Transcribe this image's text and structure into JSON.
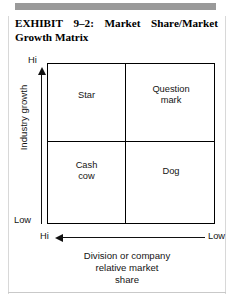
{
  "exhibit": {
    "label": "EXHIBIT",
    "number": "9–2:",
    "title_part_1": "Market",
    "title_part_2": "Share/Market",
    "title_line_2": "Growth Matrix",
    "full_title": "EXHIBIT 9–2: Market Share/Market Growth Matrix"
  },
  "chart_data": {
    "type": "table",
    "title": "Market Share/Market Growth Matrix",
    "xlabel": "Division or company relative market share",
    "ylabel": "Industry growth",
    "x_ticks": [
      "Hi",
      "Low"
    ],
    "y_ticks": [
      "Hi",
      "Low"
    ],
    "x_axis_direction": "decreasing-left-to-right",
    "y_axis_direction": "increasing-bottom-to-top",
    "grid": false,
    "legend": "none",
    "rows": 2,
    "columns": 2,
    "quadrants": [
      {
        "id": "star",
        "label": "Star",
        "industry_growth": "Hi",
        "relative_market_share": "Hi",
        "row": 0,
        "col": 0
      },
      {
        "id": "question-mark",
        "label": "Question\nmark",
        "industry_growth": "Hi",
        "relative_market_share": "Low",
        "row": 0,
        "col": 1
      },
      {
        "id": "cash-cow",
        "label": "Cash\ncow",
        "industry_growth": "Low",
        "relative_market_share": "Hi",
        "row": 1,
        "col": 0
      },
      {
        "id": "dog",
        "label": "Dog",
        "industry_growth": "Low",
        "relative_market_share": "Low",
        "row": 1,
        "col": 1
      }
    ]
  },
  "axes": {
    "vertical": {
      "title": "Industry growth",
      "top_label": "Hi",
      "bottom_label": "Low"
    },
    "horizontal": {
      "title": "Division or company\nrelative market\nshare",
      "left_label": "Hi",
      "right_label": "Low"
    }
  },
  "colors": {
    "ink": "#141414",
    "rule": "#9a9a9a",
    "page_border": "#d8d8d8",
    "background": "#ffffff"
  }
}
